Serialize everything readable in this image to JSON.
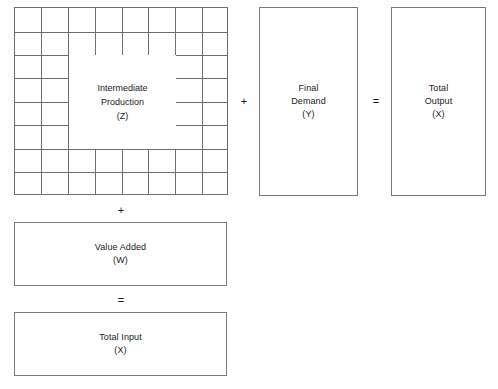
{
  "diagram": {
    "matrix": {
      "name": "intermediate-production-matrix",
      "rows": 8,
      "cols": 8,
      "label_lines": [
        "Intermediate",
        "Production",
        "(Z)"
      ]
    },
    "blocks": [
      {
        "key": "final_demand",
        "name": "final-demand-box",
        "label_lines": [
          "Final",
          "Demand",
          "(Y)"
        ]
      },
      {
        "key": "total_output",
        "name": "total-output-box",
        "label_lines": [
          "Total",
          "Output",
          "(X)"
        ]
      },
      {
        "key": "value_added",
        "name": "value-added-box",
        "label_lines": [
          "Value Added",
          "(W)"
        ]
      },
      {
        "key": "total_input",
        "name": "total-input-box",
        "label_lines": [
          "Total Input",
          "(X)"
        ]
      }
    ],
    "operators": {
      "plus_row": "+",
      "equals_row": "=",
      "plus_col": "+",
      "equals_col": "="
    },
    "colors": {
      "stroke": "#7a7a7a",
      "grid_stroke": "#6e6e6e",
      "background": "#ffffff",
      "text": "#1a1a1a"
    }
  }
}
